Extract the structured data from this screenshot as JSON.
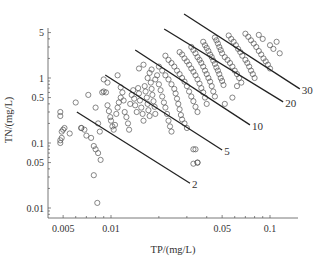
{
  "chart_data": {
    "type": "scatter",
    "title": "",
    "xlabel": "TP/(mg/L)",
    "ylabel": "TN/(mg/L)",
    "xscale": "log",
    "yscale": "log",
    "xlim": [
      0.0035,
      0.15
    ],
    "ylim": [
      0.006,
      5.5
    ],
    "grid": false,
    "xticks": [
      {
        "value": 0.005,
        "label": "0.005"
      },
      {
        "value": 0.01,
        "label": "0.01"
      },
      {
        "value": 0.05,
        "label": "0.05"
      },
      {
        "value": 0.1,
        "label": "0.1"
      }
    ],
    "yticks": [
      {
        "value": 0.01,
        "label": "0.01"
      },
      {
        "value": 0.05,
        "label": "0.05"
      },
      {
        "value": 0.1,
        "label": "0.1"
      },
      {
        "value": 0.5,
        "label": "0.5"
      },
      {
        "value": 1,
        "label": "1"
      },
      {
        "value": 5,
        "label": "5"
      }
    ],
    "reference_lines": [
      {
        "label": "2",
        "x": [
          0.0061,
          0.0314
        ],
        "y": [
          0.3,
          0.024
        ]
      },
      {
        "label": "5",
        "x": [
          0.0092,
          0.05
        ],
        "y": [
          1.11,
          0.078
        ]
      },
      {
        "label": "10",
        "x": [
          0.0142,
          0.0748
        ],
        "y": [
          2.7,
          0.19
        ]
      },
      {
        "label": "20",
        "x": [
          0.0216,
          0.121
        ],
        "y": [
          5.67,
          0.43
        ]
      },
      {
        "label": "30",
        "x": [
          0.0288,
          0.154
        ],
        "y": [
          9.66,
          0.68
        ]
      }
    ],
    "series": [
      {
        "name": "samples",
        "marker": "open-circle",
        "points": [
          [
            0.0048,
            0.3
          ],
          [
            0.0048,
            0.26
          ],
          [
            0.005,
            0.16
          ],
          [
            0.0049,
            0.15
          ],
          [
            0.0048,
            0.11
          ],
          [
            0.0048,
            0.1
          ],
          [
            0.0049,
            0.12
          ],
          [
            0.0051,
            0.17
          ],
          [
            0.0055,
            0.14
          ],
          [
            0.006,
            0.42
          ],
          [
            0.0065,
            0.17
          ],
          [
            0.0065,
            0.17
          ],
          [
            0.0068,
            0.16
          ],
          [
            0.007,
            0.13
          ],
          [
            0.0075,
            0.12
          ],
          [
            0.0078,
            0.09
          ],
          [
            0.008,
            0.08
          ],
          [
            0.0083,
            0.07
          ],
          [
            0.0086,
            0.055
          ],
          [
            0.0078,
            0.032
          ],
          [
            0.0082,
            0.012
          ],
          [
            0.0072,
            0.55
          ],
          [
            0.008,
            0.35
          ],
          [
            0.0083,
            0.2
          ],
          [
            0.0085,
            0.15
          ],
          [
            0.0088,
            0.6
          ],
          [
            0.009,
            0.62
          ],
          [
            0.0093,
            0.6
          ],
          [
            0.0095,
            0.38
          ],
          [
            0.0097,
            0.31
          ],
          [
            0.0099,
            0.25
          ],
          [
            0.01,
            0.22
          ],
          [
            0.0102,
            0.18
          ],
          [
            0.0104,
            0.16
          ],
          [
            0.0106,
            0.19
          ],
          [
            0.0108,
            0.28
          ],
          [
            0.011,
            0.35
          ],
          [
            0.0112,
            0.42
          ],
          [
            0.0115,
            0.5
          ],
          [
            0.009,
            0.95
          ],
          [
            0.0095,
            0.85
          ],
          [
            0.011,
            1.1
          ],
          [
            0.0115,
            0.72
          ],
          [
            0.0118,
            0.6
          ],
          [
            0.012,
            0.45
          ],
          [
            0.0122,
            0.3
          ],
          [
            0.0125,
            0.25
          ],
          [
            0.0128,
            0.2
          ],
          [
            0.013,
            0.16
          ],
          [
            0.0132,
            0.4
          ],
          [
            0.0135,
            0.55
          ],
          [
            0.0138,
            0.65
          ],
          [
            0.014,
            0.48
          ],
          [
            0.0142,
            0.38
          ],
          [
            0.0145,
            0.3
          ],
          [
            0.0148,
            0.7
          ],
          [
            0.015,
            0.58
          ],
          [
            0.0152,
            0.45
          ],
          [
            0.0155,
            0.35
          ],
          [
            0.0158,
            0.28
          ],
          [
            0.016,
            0.22
          ],
          [
            0.0163,
            0.75
          ],
          [
            0.0165,
            0.62
          ],
          [
            0.0168,
            0.5
          ],
          [
            0.017,
            0.4
          ],
          [
            0.0172,
            0.32
          ],
          [
            0.0175,
            0.26
          ],
          [
            0.0178,
            0.85
          ],
          [
            0.018,
            0.68
          ],
          [
            0.0182,
            0.55
          ],
          [
            0.0185,
            0.44
          ],
          [
            0.0188,
            0.36
          ],
          [
            0.019,
            0.28
          ],
          [
            0.015,
            1.4
          ],
          [
            0.016,
            1.6
          ],
          [
            0.017,
            1.0
          ],
          [
            0.0175,
            1.2
          ],
          [
            0.018,
            1.35
          ],
          [
            0.019,
            0.95
          ],
          [
            0.0195,
            1.1
          ],
          [
            0.02,
            0.8
          ],
          [
            0.0205,
            0.65
          ],
          [
            0.021,
            0.52
          ],
          [
            0.0215,
            0.42
          ],
          [
            0.022,
            0.35
          ],
          [
            0.0225,
            0.28
          ],
          [
            0.023,
            0.22
          ],
          [
            0.0235,
            0.18
          ],
          [
            0.024,
            0.15
          ],
          [
            0.02,
            1.5
          ],
          [
            0.021,
            1.3
          ],
          [
            0.022,
            1.1
          ],
          [
            0.023,
            0.95
          ],
          [
            0.024,
            0.8
          ],
          [
            0.025,
            0.68
          ],
          [
            0.0255,
            0.58
          ],
          [
            0.026,
            0.48
          ],
          [
            0.0265,
            0.4
          ],
          [
            0.027,
            0.33
          ],
          [
            0.0275,
            0.27
          ],
          [
            0.028,
            0.23
          ],
          [
            0.029,
            0.2
          ],
          [
            0.03,
            0.17
          ],
          [
            0.022,
            2.2
          ],
          [
            0.023,
            1.9
          ],
          [
            0.024,
            1.7
          ],
          [
            0.025,
            1.5
          ],
          [
            0.026,
            1.3
          ],
          [
            0.027,
            1.15
          ],
          [
            0.028,
            1.0
          ],
          [
            0.029,
            0.88
          ],
          [
            0.03,
            0.75
          ],
          [
            0.031,
            0.62
          ],
          [
            0.032,
            0.52
          ],
          [
            0.033,
            0.44
          ],
          [
            0.034,
            0.36
          ],
          [
            0.035,
            0.3
          ],
          [
            0.027,
            2.5
          ],
          [
            0.028,
            2.3
          ],
          [
            0.029,
            2.0
          ],
          [
            0.03,
            1.8
          ],
          [
            0.031,
            1.6
          ],
          [
            0.032,
            1.4
          ],
          [
            0.033,
            1.25
          ],
          [
            0.034,
            1.1
          ],
          [
            0.035,
            0.95
          ],
          [
            0.036,
            0.82
          ],
          [
            0.037,
            0.7
          ],
          [
            0.038,
            0.6
          ],
          [
            0.039,
            0.5
          ],
          [
            0.04,
            0.4
          ],
          [
            0.033,
            0.08
          ],
          [
            0.034,
            0.08
          ],
          [
            0.035,
            0.05
          ],
          [
            0.032,
            3.0
          ],
          [
            0.033,
            2.7
          ],
          [
            0.034,
            2.4
          ],
          [
            0.035,
            2.1
          ],
          [
            0.036,
            1.9
          ],
          [
            0.037,
            1.7
          ],
          [
            0.038,
            1.5
          ],
          [
            0.039,
            1.3
          ],
          [
            0.04,
            1.15
          ],
          [
            0.041,
            1.0
          ],
          [
            0.042,
            0.88
          ],
          [
            0.043,
            0.75
          ],
          [
            0.044,
            0.62
          ],
          [
            0.045,
            0.52
          ],
          [
            0.038,
            3.6
          ],
          [
            0.039,
            3.2
          ],
          [
            0.04,
            2.9
          ],
          [
            0.041,
            2.6
          ],
          [
            0.042,
            2.3
          ],
          [
            0.043,
            2.1
          ],
          [
            0.044,
            1.85
          ],
          [
            0.045,
            1.65
          ],
          [
            0.046,
            1.45
          ],
          [
            0.047,
            1.3
          ],
          [
            0.048,
            1.15
          ],
          [
            0.049,
            1.0
          ],
          [
            0.05,
            0.9
          ],
          [
            0.051,
            0.78
          ],
          [
            0.045,
            4.2
          ],
          [
            0.046,
            3.8
          ],
          [
            0.047,
            3.4
          ],
          [
            0.048,
            3.0
          ],
          [
            0.049,
            2.7
          ],
          [
            0.05,
            2.4
          ],
          [
            0.052,
            2.1
          ],
          [
            0.054,
            1.9
          ],
          [
            0.056,
            1.7
          ],
          [
            0.058,
            1.5
          ],
          [
            0.06,
            1.3
          ],
          [
            0.062,
            1.15
          ],
          [
            0.064,
            1.0
          ],
          [
            0.066,
            0.85
          ],
          [
            0.055,
            4.5
          ],
          [
            0.057,
            4.0
          ],
          [
            0.059,
            3.6
          ],
          [
            0.061,
            3.2
          ],
          [
            0.063,
            2.8
          ],
          [
            0.065,
            2.5
          ],
          [
            0.067,
            2.2
          ],
          [
            0.07,
            1.9
          ],
          [
            0.072,
            1.7
          ],
          [
            0.074,
            1.5
          ],
          [
            0.076,
            1.3
          ],
          [
            0.078,
            1.15
          ],
          [
            0.08,
            1.0
          ],
          [
            0.07,
            4.8
          ],
          [
            0.073,
            4.3
          ],
          [
            0.076,
            3.8
          ],
          [
            0.079,
            3.4
          ],
          [
            0.082,
            3.0
          ],
          [
            0.085,
            2.6
          ],
          [
            0.088,
            2.3
          ],
          [
            0.091,
            2.0
          ],
          [
            0.094,
            1.8
          ],
          [
            0.097,
            1.6
          ],
          [
            0.1,
            1.4
          ],
          [
            0.085,
            4.6
          ],
          [
            0.09,
            4.0
          ],
          [
            0.1,
            3.2
          ],
          [
            0.105,
            2.8
          ],
          [
            0.11,
            3.6
          ],
          [
            0.115,
            2.4
          ],
          [
            0.058,
            0.5
          ],
          [
            0.052,
            0.4
          ],
          [
            0.035,
            0.05
          ],
          [
            0.033,
            0.048
          ],
          [
            0.062,
            0.75
          ]
        ]
      }
    ]
  }
}
